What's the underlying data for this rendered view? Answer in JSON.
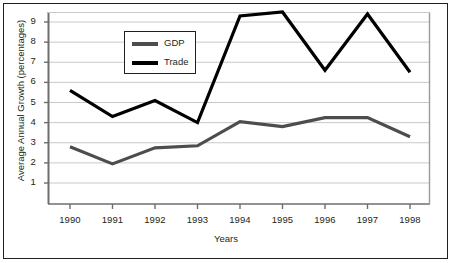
{
  "chart_data": {
    "type": "line",
    "title": "",
    "xlabel": "Years",
    "ylabel": "Average Annual Growth (percentages)",
    "categories": [
      "1990",
      "1991",
      "1992",
      "1993",
      "1994",
      "1995",
      "1996",
      "1997",
      "1998"
    ],
    "x_tick_labels": [
      "1990",
      "1991",
      "1992",
      "1993",
      "1994",
      "1995",
      "1996",
      "1997",
      "1998"
    ],
    "y_tick_labels": [
      "1",
      "2",
      "3",
      "4",
      "5",
      "6",
      "7",
      "8",
      "9"
    ],
    "y_ticks": [
      1,
      2,
      3,
      4,
      5,
      6,
      7,
      8,
      9
    ],
    "ylim": [
      0,
      9.8
    ],
    "grid": "horizontal",
    "legend_position": "upper-left-inside",
    "series": [
      {
        "name": "GDP",
        "color": "#4d4d4d",
        "values": [
          2.8,
          1.95,
          2.75,
          2.85,
          4.05,
          3.8,
          4.25,
          4.25,
          3.3
        ]
      },
      {
        "name": "Trade",
        "color": "#000000",
        "values": [
          5.6,
          4.3,
          5.1,
          4.0,
          9.3,
          9.5,
          6.6,
          9.4,
          6.5
        ]
      }
    ]
  },
  "legend": {
    "entries": [
      {
        "label": "GDP"
      },
      {
        "label": "Trade"
      }
    ]
  },
  "axes": {
    "x_title": "Years",
    "y_title": "Average Annual Growth (percentages)"
  },
  "colors": {
    "frame": "#231f20",
    "grid": "#c9c9c9",
    "axis": "#6e6e6e",
    "gdp": "#4d4d4d",
    "trade": "#000000",
    "background": "#ffffff"
  }
}
